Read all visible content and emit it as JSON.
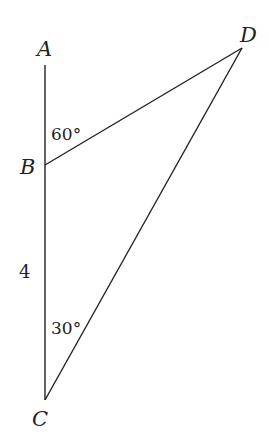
{
  "diagram": {
    "points": {
      "A": {
        "label": "A",
        "x": 45,
        "y": 65
      },
      "B": {
        "label": "B",
        "x": 45,
        "y": 165
      },
      "C": {
        "label": "C",
        "x": 45,
        "y": 400
      },
      "D": {
        "label": "D",
        "x": 242,
        "y": 48
      }
    },
    "segments": [
      {
        "from": "A",
        "to": "C"
      },
      {
        "from": "B",
        "to": "D"
      },
      {
        "from": "C",
        "to": "D"
      }
    ],
    "angles": {
      "ABD": "60°",
      "BCD": "30°"
    },
    "lengths": {
      "BC": "4"
    },
    "line_color": "#222222"
  }
}
